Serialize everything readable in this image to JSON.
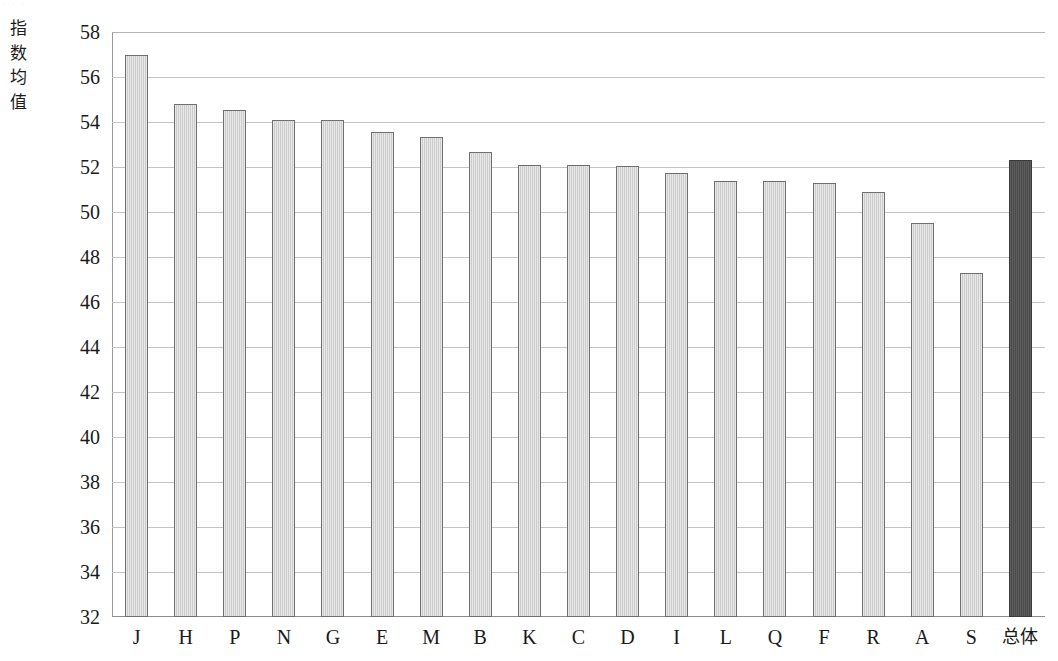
{
  "page": {
    "cropped_line_above": "，，，"
  },
  "axis": {
    "y_title_chars": [
      "指",
      "数",
      "均",
      "值"
    ],
    "y_title": "指数均值",
    "y_ticks": [
      58,
      56,
      54,
      52,
      50,
      48,
      46,
      44,
      42,
      40,
      38,
      36,
      34,
      32
    ]
  },
  "chart_data": {
    "type": "bar",
    "title": "",
    "subtitle": "",
    "xlabel": "",
    "ylabel": "指数均值",
    "ylim": [
      32,
      58
    ],
    "ytick_step": 2,
    "grid": true,
    "legend": "none",
    "categories": [
      "J",
      "H",
      "P",
      "N",
      "G",
      "E",
      "M",
      "B",
      "K",
      "C",
      "D",
      "I",
      "L",
      "Q",
      "F",
      "R",
      "A",
      "S",
      "总体"
    ],
    "values": [
      57.0,
      54.8,
      54.55,
      54.1,
      54.1,
      53.55,
      53.35,
      52.65,
      52.1,
      52.1,
      52.05,
      51.75,
      51.4,
      51.4,
      51.3,
      50.9,
      49.5,
      47.3,
      52.3
    ],
    "highlight_index": 18,
    "highlight_category": "总体",
    "bar_color": "#cccccc",
    "bar_edge_color": "#6f6f6f",
    "highlight_color": "#4b4b4b",
    "grid_color": "#c4c4c4",
    "axis_color": "#8d8d8d"
  }
}
